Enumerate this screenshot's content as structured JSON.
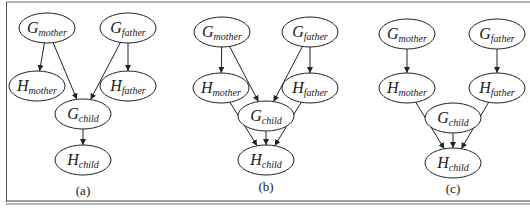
{
  "figure": {
    "colors": {
      "stroke": "#222222",
      "background": "#ffffff",
      "frame": "#555555"
    },
    "panels": [
      {
        "id": "a",
        "caption": "(a)",
        "nodes": [
          {
            "id": "Gm",
            "main": "G",
            "sub": "mother",
            "cx": 47,
            "cy": 28
          },
          {
            "id": "Gf",
            "main": "G",
            "sub": "father",
            "cx": 128,
            "cy": 28
          },
          {
            "id": "Hm",
            "main": "H",
            "sub": "mother",
            "cx": 37,
            "cy": 86
          },
          {
            "id": "Hf",
            "main": "H",
            "sub": "father",
            "cx": 128,
            "cy": 86
          },
          {
            "id": "Gc",
            "main": "G",
            "sub": "child",
            "cx": 83,
            "cy": 114
          },
          {
            "id": "Hc",
            "main": "H",
            "sub": "child",
            "cx": 83,
            "cy": 160
          }
        ],
        "edges": [
          [
            "Gm",
            "Hm"
          ],
          [
            "Gf",
            "Hf"
          ],
          [
            "Gm",
            "Gc"
          ],
          [
            "Gf",
            "Gc"
          ],
          [
            "Gc",
            "Hc"
          ]
        ]
      },
      {
        "id": "b",
        "caption": "(b)",
        "nodes": [
          {
            "id": "Gm",
            "main": "G",
            "sub": "mother",
            "cx": 222,
            "cy": 32
          },
          {
            "id": "Gf",
            "main": "G",
            "sub": "father",
            "cx": 310,
            "cy": 32
          },
          {
            "id": "Hm",
            "main": "H",
            "sub": "mother",
            "cx": 221,
            "cy": 88
          },
          {
            "id": "Hf",
            "main": "H",
            "sub": "father",
            "cx": 310,
            "cy": 88
          },
          {
            "id": "Gc",
            "main": "G",
            "sub": "child",
            "cx": 266,
            "cy": 116
          },
          {
            "id": "Hc",
            "main": "H",
            "sub": "child",
            "cx": 266,
            "cy": 160
          }
        ],
        "edges": [
          [
            "Gm",
            "Hm"
          ],
          [
            "Gf",
            "Hf"
          ],
          [
            "Gm",
            "Gc"
          ],
          [
            "Gf",
            "Gc"
          ],
          [
            "Hm",
            "Hc"
          ],
          [
            "Gc",
            "Hc"
          ],
          [
            "Hf",
            "Hc"
          ]
        ]
      },
      {
        "id": "c",
        "caption": "(c)",
        "nodes": [
          {
            "id": "Gm",
            "main": "G",
            "sub": "mother",
            "cx": 407,
            "cy": 34
          },
          {
            "id": "Gf",
            "main": "G",
            "sub": "father",
            "cx": 497,
            "cy": 34
          },
          {
            "id": "Hm",
            "main": "H",
            "sub": "mother",
            "cx": 407,
            "cy": 88
          },
          {
            "id": "Hf",
            "main": "H",
            "sub": "father",
            "cx": 497,
            "cy": 88
          },
          {
            "id": "Gc",
            "main": "G",
            "sub": "child",
            "cx": 453,
            "cy": 118
          },
          {
            "id": "Hc",
            "main": "H",
            "sub": "child",
            "cx": 453,
            "cy": 163
          }
        ],
        "edges": [
          [
            "Gm",
            "Hm"
          ],
          [
            "Gf",
            "Hf"
          ],
          [
            "Hm",
            "Hc"
          ],
          [
            "Gc",
            "Hc"
          ],
          [
            "Hf",
            "Hc"
          ]
        ]
      }
    ],
    "caption_positions": {
      "a": [
        83,
        195
      ],
      "b": [
        266,
        191
      ],
      "c": [
        453,
        193
      ]
    }
  }
}
